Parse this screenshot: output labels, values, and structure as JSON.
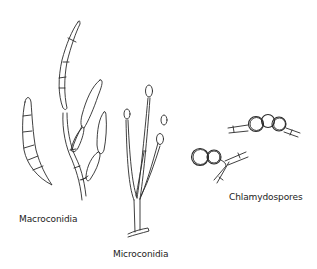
{
  "diagram": {
    "labels": {
      "macroconidia": "Macroconidia",
      "microconidia": "Microconidia",
      "chlamydospores": "Chlamydospores"
    },
    "colors": {
      "line": "#2a2a2a",
      "background": "#ffffff",
      "text": "#222222"
    }
  }
}
